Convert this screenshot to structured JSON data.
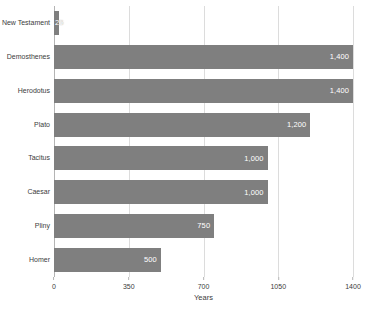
{
  "chart_data": {
    "type": "bar",
    "orientation": "horizontal",
    "title": "",
    "xlabel": "Years",
    "ylabel": "",
    "xlim": [
      0,
      1400
    ],
    "xticks": [
      "0",
      "350",
      "700",
      "1050",
      "1400"
    ],
    "xtick_values": [
      0,
      350,
      700,
      1050,
      1400
    ],
    "grid": true,
    "legend": false,
    "bar_color": "#7f7f7f",
    "gridline_color": "#dcdcdc",
    "label_color": "#3c3c3c",
    "value_label_color": "#ffffff",
    "categories": [
      "New Testament",
      "Demosthenes",
      "Herodotus",
      "Plato",
      "Tacitus",
      "Caesar",
      "Pliny",
      "Homer"
    ],
    "values": [
      25,
      1400,
      1400,
      1200,
      1000,
      1000,
      750,
      500
    ],
    "value_labels": [
      "25",
      "1,400",
      "1,400",
      "1,200",
      "1,000",
      "1,000",
      "750",
      "500"
    ]
  }
}
